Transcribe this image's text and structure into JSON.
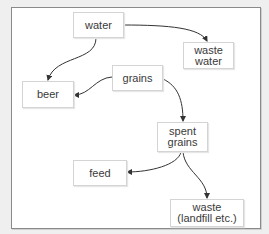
{
  "diagram": {
    "type": "flowchart",
    "nodes": [
      {
        "id": "water",
        "label": "water"
      },
      {
        "id": "waste_water",
        "label": "waste\nwater"
      },
      {
        "id": "grains",
        "label": "grains"
      },
      {
        "id": "beer",
        "label": "beer"
      },
      {
        "id": "spent_grains",
        "label": "spent\ngrains"
      },
      {
        "id": "feed",
        "label": "feed"
      },
      {
        "id": "waste",
        "label": "waste\n(landfill etc.)"
      }
    ],
    "edges": [
      {
        "from": "water",
        "to": "waste_water"
      },
      {
        "from": "water",
        "to": "beer"
      },
      {
        "from": "grains",
        "to": "beer"
      },
      {
        "from": "grains",
        "to": "spent_grains"
      },
      {
        "from": "spent_grains",
        "to": "feed"
      },
      {
        "from": "spent_grains",
        "to": "waste"
      }
    ],
    "colors": {
      "background": "#efefef",
      "frame": "#ffffff",
      "frame_border": "#8a8a8a",
      "node_border": "#d4d4d4",
      "text": "#3a3a3a",
      "edge": "#333333"
    }
  }
}
